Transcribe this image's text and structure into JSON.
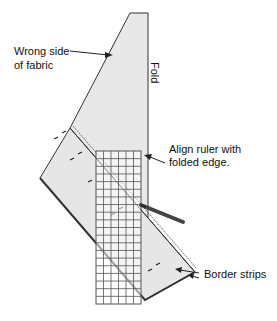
{
  "diagram": {
    "labels": {
      "wrong_side_line1": "Wrong side",
      "wrong_side_line2": "of fabric",
      "fold": "Fold",
      "align_line1": "Align ruler with",
      "align_line2": "folded edge.",
      "border_strips": "Border strips"
    },
    "colors": {
      "fabric_fill": "#e8e8e8",
      "outline": "#333333",
      "grid_line": "#555555",
      "pencil": "#444444"
    },
    "ruler": {
      "columns": 6,
      "rows": 20
    }
  }
}
